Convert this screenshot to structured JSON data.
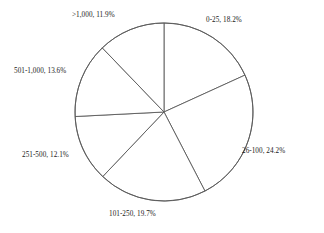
{
  "chart_data": {
    "type": "pie",
    "title": "",
    "subtitle": "",
    "xlabel": "",
    "ylabel": "",
    "legend_position": "none",
    "grid": false,
    "start_angle_deg": 0,
    "direction": "clockwise",
    "center": {
      "x": 164,
      "y": 112
    },
    "radius": 89,
    "categories": [
      "0-25",
      "26-100",
      "101-250",
      "251-500",
      "501-1,000",
      ">1,000"
    ],
    "values": [
      18.2,
      24.2,
      19.7,
      12.1,
      13.6,
      11.9
    ],
    "value_unit": "%",
    "slices": [
      {
        "category": "0-25",
        "value": 18.2,
        "label": "0-25, 18.2%",
        "start_angle_deg": 0.0,
        "end_angle_deg": 65.5,
        "fill": "#ffffff",
        "stroke": "#5a5a5a"
      },
      {
        "category": "26-100",
        "value": 24.2,
        "label": "26-100, 24.2%",
        "start_angle_deg": 65.5,
        "end_angle_deg": 152.6,
        "fill": "#ffffff",
        "stroke": "#5a5a5a"
      },
      {
        "category": "101-250",
        "value": 19.7,
        "label": "101-250, 19.7%",
        "start_angle_deg": 152.6,
        "end_angle_deg": 223.5,
        "fill": "#ffffff",
        "stroke": "#5a5a5a"
      },
      {
        "category": "251-500",
        "value": 12.1,
        "label": "251-500, 12.1%",
        "start_angle_deg": 223.5,
        "end_angle_deg": 267.1,
        "fill": "#ffffff",
        "stroke": "#5a5a5a"
      },
      {
        "category": "501-1,000",
        "value": 13.6,
        "label": "501-1,000, 13.6%",
        "start_angle_deg": 267.1,
        "end_angle_deg": 316.1,
        "fill": "#ffffff",
        "stroke": "#5a5a5a"
      },
      {
        "category": ">1,000",
        "value": 11.9,
        "label": ">1,000, 11.9%",
        "start_angle_deg": 316.1,
        "end_angle_deg": 360.0,
        "fill": "#ffffff",
        "stroke": "#5a5a5a"
      }
    ]
  },
  "colors": {
    "background": "#ffffff",
    "line": "#5a5a5a",
    "text": "#1a1a1a"
  }
}
